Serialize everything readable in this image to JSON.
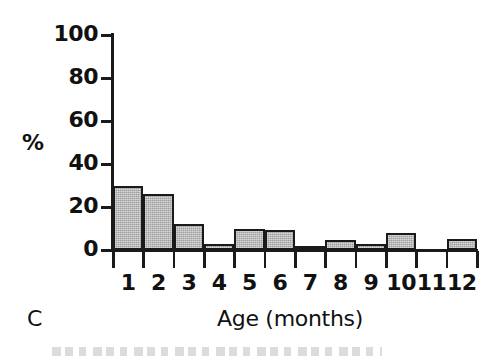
{
  "panel": {
    "label": "C"
  },
  "chart_data": {
    "type": "bar",
    "title": "",
    "subtitle": "",
    "xlabel": "Age (months)",
    "ylabel": "%",
    "categories": [
      "1",
      "2",
      "3",
      "4",
      "5",
      "6",
      "7",
      "8",
      "9",
      "10",
      "11",
      "12"
    ],
    "values": [
      30,
      26,
      12,
      3,
      10,
      9.5,
      1.5,
      4.5,
      3,
      8,
      0,
      5
    ],
    "series": [
      {
        "name": "Percentage of cases",
        "values": [
          30,
          26,
          12,
          3,
          10,
          9.5,
          1.5,
          4.5,
          3,
          8,
          0,
          5
        ]
      }
    ],
    "ylim": [
      0,
      100
    ],
    "yticks": [
      0,
      20,
      40,
      60,
      80,
      100
    ],
    "ytick_labels": [
      "0",
      "20",
      "40",
      "60",
      "80",
      "100"
    ],
    "xtick_labels": [
      "1",
      "2",
      "3",
      "4",
      "5",
      "6",
      "7",
      "8",
      "9",
      "10",
      "11",
      "12"
    ],
    "grid": false,
    "legend": "none",
    "bar_fill_color": "#b4b4b4",
    "bar_edge_color": "#1a1a1a",
    "axis_color": "#1a1a1a",
    "background_color": "#ffffff"
  }
}
